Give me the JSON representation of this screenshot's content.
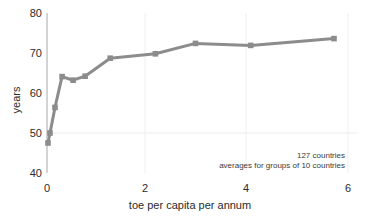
{
  "chart_data": {
    "type": "line",
    "title": "",
    "xlabel": "toe per capita per annum",
    "ylabel": "years",
    "xlim": [
      0,
      6
    ],
    "ylim": [
      40,
      80
    ],
    "xticks": [
      "0",
      "2",
      "4",
      "6"
    ],
    "xtick_values": [
      0,
      2,
      4,
      6
    ],
    "yticks": [
      "40",
      "50",
      "60",
      "70",
      "80"
    ],
    "ytick_values": [
      40,
      50,
      60,
      70,
      80
    ],
    "grid": "faint horizontal line at y=50 and faint vertical lines at x=2,4,6",
    "legend": "none",
    "series": [
      {
        "name": "life expectancy vs energy use",
        "color": "#8c8c8c",
        "x": [
          0.02,
          0.06,
          0.16,
          0.3,
          0.52,
          0.76,
          1.26,
          2.16,
          2.96,
          4.06,
          5.72
        ],
        "y": [
          47.5,
          50.0,
          56.4,
          64.1,
          63.2,
          64.2,
          68.7,
          69.8,
          72.4,
          71.9,
          73.6
        ]
      }
    ],
    "annotations": [
      "127 countries",
      "averages for groups of 10 countries"
    ]
  },
  "axis": {
    "x_label": "toe per capita per annum",
    "y_label": "years",
    "x_tick_0": "0",
    "x_tick_1": "2",
    "x_tick_2": "4",
    "x_tick_3": "6",
    "y_tick_0": "40",
    "y_tick_1": "50",
    "y_tick_2": "60",
    "y_tick_3": "70",
    "y_tick_4": "80"
  },
  "notes": {
    "line1": "127 countries",
    "line2": "averages for groups of 10 countries"
  },
  "colors": {
    "series": "#8c8c8c",
    "axis": "#9a9a9a",
    "grid": "#e6e6e6",
    "text": "#2b2b2b"
  }
}
